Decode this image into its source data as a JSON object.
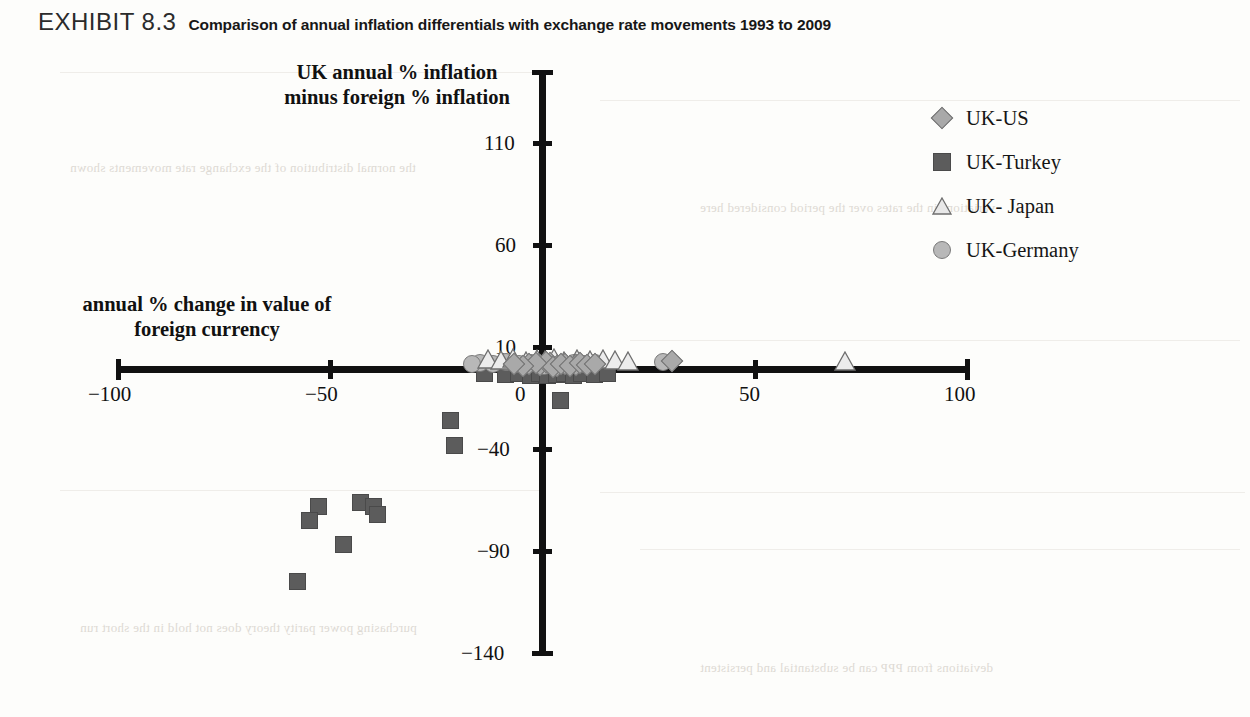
{
  "header": {
    "exhibit_label": "EXHIBIT 8.3",
    "title": "Comparison of annual inflation differentials with exchange rate movements 1993 to 2009"
  },
  "legend": {
    "items": [
      {
        "label": "UK-US",
        "symbol": "diamond-marker",
        "color": "#a9a9a9"
      },
      {
        "label": "UK-Turkey",
        "symbol": "square-marker",
        "color": "#5c5c5c"
      },
      {
        "label": "UK- Japan",
        "symbol": "triangle-marker",
        "color": "#e3e3e3"
      },
      {
        "label": "UK-Germany",
        "symbol": "circle-marker",
        "color": "#b8b8b8"
      }
    ]
  },
  "chart_data": {
    "type": "scatter",
    "title": "Comparison of annual inflation differentials with exchange rate movements 1993 to 2009",
    "xlabel": "annual % change in value of foreign currency",
    "ylabel": "UK annual % inflation minus foreign % inflation",
    "xlim": [
      -100,
      100
    ],
    "ylim": [
      -140,
      130
    ],
    "xticks": [
      -100,
      -50,
      0,
      50,
      100
    ],
    "yticks": [
      110,
      60,
      10,
      -40,
      -90,
      -140
    ],
    "xtick_labels": [
      "−100",
      "−50",
      "0",
      "50",
      "100"
    ],
    "ytick_labels": [
      "110",
      "60",
      "10",
      "−40",
      "−90",
      "−140"
    ],
    "grid": false,
    "legend_position": "top-right",
    "series": [
      {
        "name": "UK-US",
        "marker": "diamond",
        "color": "#a9a9a9",
        "points": [
          [
            -3.5,
            2.0
          ],
          [
            -1.0,
            1.5
          ],
          [
            1.5,
            2.5
          ],
          [
            3.0,
            1.0
          ],
          [
            5.0,
            2.0
          ],
          [
            7.5,
            1.5
          ],
          [
            0.5,
            3.0
          ],
          [
            2.0,
            0.5
          ],
          [
            -2.0,
            2.5
          ],
          [
            4.0,
            2.0
          ],
          [
            6.0,
            1.0
          ],
          [
            8.5,
            2.5
          ],
          [
            30.0,
            3.5
          ],
          [
            10.0,
            1.5
          ],
          [
            -5.0,
            1.0
          ],
          [
            12.0,
            2.0
          ],
          [
            -7.0,
            2.0
          ]
        ]
      },
      {
        "name": "UK-Turkey",
        "marker": "square",
        "color": "#5c5c5c",
        "points": [
          [
            -14.0,
            -3.0
          ],
          [
            -9.0,
            -3.5
          ],
          [
            -6.0,
            -3.0
          ],
          [
            -3.0,
            -4.0
          ],
          [
            -1.0,
            -3.0
          ],
          [
            1.0,
            -4.0
          ],
          [
            3.0,
            -3.5
          ],
          [
            5.0,
            -3.0
          ],
          [
            7.0,
            -4.0
          ],
          [
            9.0,
            -3.0
          ],
          [
            12.0,
            -3.5
          ],
          [
            15.0,
            -3.0
          ],
          [
            4.0,
            -16.0
          ],
          [
            -22.0,
            -26.0
          ],
          [
            -21.0,
            -38.0
          ],
          [
            -53.0,
            -68.0
          ],
          [
            -55.0,
            -75.0
          ],
          [
            -43.0,
            -66.0
          ],
          [
            -40.0,
            -68.0
          ],
          [
            -39.0,
            -72.0
          ],
          [
            -47.0,
            -87.0
          ],
          [
            -58.0,
            -105.0
          ]
        ]
      },
      {
        "name": "UK- Japan",
        "marker": "triangle",
        "color": "#e3e3e3",
        "points": [
          [
            -13.0,
            4.0
          ],
          [
            -10.0,
            3.5
          ],
          [
            -7.0,
            4.5
          ],
          [
            -4.0,
            3.0
          ],
          [
            -1.5,
            4.0
          ],
          [
            0.5,
            3.5
          ],
          [
            2.5,
            4.5
          ],
          [
            5.0,
            3.0
          ],
          [
            8.0,
            4.0
          ],
          [
            11.0,
            3.5
          ],
          [
            14.0,
            4.0
          ],
          [
            17.0,
            3.5
          ],
          [
            20.0,
            3.0
          ],
          [
            71.0,
            3.0
          ]
        ]
      },
      {
        "name": "UK-Germany",
        "marker": "circle",
        "color": "#b8b8b8",
        "points": [
          [
            -15.0,
            2.5
          ],
          [
            -12.0,
            2.0
          ],
          [
            -9.0,
            3.0
          ],
          [
            -6.0,
            2.0
          ],
          [
            -3.0,
            2.5
          ],
          [
            -0.5,
            2.0
          ],
          [
            2.0,
            3.0
          ],
          [
            4.5,
            1.5
          ],
          [
            7.0,
            2.5
          ],
          [
            9.5,
            2.0
          ],
          [
            12.0,
            2.5
          ],
          [
            28.0,
            3.0
          ],
          [
            -17.0,
            2.0
          ],
          [
            0.0,
            1.0
          ]
        ]
      }
    ]
  },
  "bleed_text": {
    "lines": [
      "the normal distribution of the exchange rate movements shown",
      "variations in the rates over the period considered here",
      "purchasing power parity theory does not hold in the short run",
      "deviations from PPP can be substantial and persistent"
    ]
  }
}
